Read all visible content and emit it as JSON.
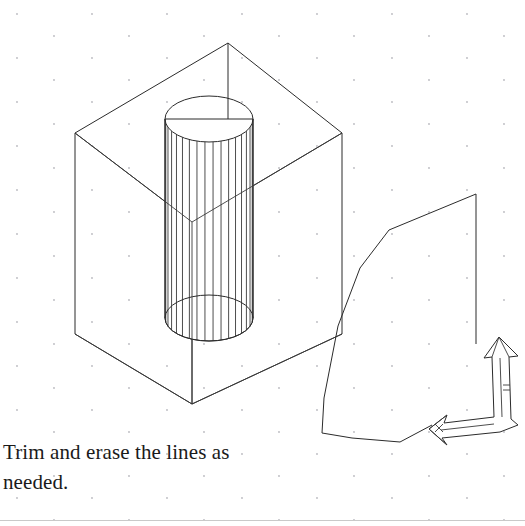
{
  "document": {
    "background_color": "#ffffff",
    "ink_color": "#2b2b2b",
    "grid_dot_color": "#b9b9bf",
    "width": 525,
    "height": 526
  },
  "caption": {
    "line1": "Trim and erase the lines as",
    "line2": "needed."
  },
  "figures": {
    "left": {
      "name": "isometric-box-with-cylinder",
      "box": {
        "top_apex": [
          228,
          43
        ],
        "top_left": [
          75,
          133
        ],
        "top_right": [
          342,
          133
        ],
        "top_back": [
          192,
          222
        ],
        "bottom_left": [
          75,
          334
        ],
        "bottom_front": [
          192,
          404
        ],
        "bottom_right": [
          342,
          334
        ],
        "vertical_edge_length": 201
      },
      "cylinder": {
        "center_x": 209,
        "radius_x": 44,
        "radius_y": 23,
        "top_center_y": 119,
        "bottom_center_y": 318,
        "ruling_line_count": 17
      }
    },
    "right": {
      "name": "partial-profile-with-bent-arrow",
      "outline_points": [
        [
          476,
          194
        ],
        [
          389,
          230
        ],
        [
          360,
          268
        ],
        [
          338,
          326
        ],
        [
          324,
          398
        ],
        [
          322,
          433
        ],
        [
          352,
          438
        ],
        [
          400,
          442
        ],
        [
          432,
          425
        ]
      ],
      "vertical_edge": [
        [
          476,
          194
        ],
        [
          476,
          344
        ]
      ],
      "arrow": {
        "type": "bent-isometric-arrow",
        "up_head_tip": [
          501,
          336
        ],
        "elbow": [
          500,
          420
        ],
        "down_left_tip": [
          428,
          428
        ]
      }
    }
  },
  "grid": {
    "dot_radius": 0.9,
    "spacing_x": 75,
    "spacing_y": 22,
    "row_offset_x": 37
  }
}
